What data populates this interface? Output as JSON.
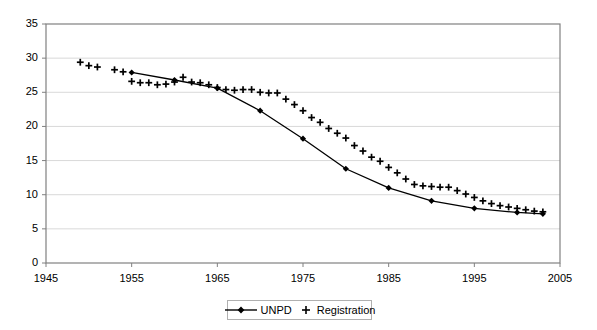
{
  "chart_data": {
    "type": "line",
    "title": "",
    "xlabel": "",
    "ylabel": "",
    "xlim": [
      1945,
      2005
    ],
    "ylim": [
      0,
      35
    ],
    "xticks": [
      1945,
      1955,
      1965,
      1975,
      1985,
      1995,
      2005
    ],
    "yticks": [
      0,
      5,
      10,
      15,
      20,
      25,
      30,
      35
    ],
    "grid": "horizontal",
    "legend_position": "bottom-center",
    "series": [
      {
        "name": "UNPD",
        "marker": "diamond",
        "line": "solid",
        "color": "#000000",
        "x": [
          1955,
          1960,
          1965,
          1970,
          1975,
          1980,
          1985,
          1990,
          1995,
          2000,
          2003
        ],
        "values": [
          27.9,
          26.8,
          25.6,
          22.3,
          18.2,
          13.8,
          11.0,
          9.1,
          8.0,
          7.4,
          7.2
        ]
      },
      {
        "name": "Registration",
        "marker": "plus",
        "line": "none",
        "color": "#000000",
        "x": [
          1949,
          1950,
          1951,
          1953,
          1954,
          1955,
          1956,
          1957,
          1958,
          1959,
          1960,
          1961,
          1962,
          1963,
          1964,
          1965,
          1966,
          1967,
          1968,
          1969,
          1970,
          1971,
          1972,
          1973,
          1974,
          1975,
          1976,
          1977,
          1978,
          1979,
          1980,
          1981,
          1982,
          1983,
          1984,
          1985,
          1986,
          1987,
          1988,
          1989,
          1990,
          1991,
          1992,
          1993,
          1994,
          1995,
          1996,
          1997,
          1998,
          1999,
          2000,
          2001,
          2002,
          2003
        ],
        "values": [
          29.4,
          28.9,
          28.7,
          28.3,
          28.0,
          26.6,
          26.4,
          26.4,
          26.1,
          26.2,
          26.5,
          27.2,
          26.5,
          26.4,
          26.1,
          25.7,
          25.4,
          25.3,
          25.4,
          25.4,
          25.0,
          24.9,
          24.9,
          24.0,
          23.2,
          22.3,
          21.3,
          20.6,
          19.7,
          19.0,
          18.3,
          17.2,
          16.4,
          15.5,
          14.9,
          14.0,
          13.2,
          12.3,
          11.5,
          11.3,
          11.2,
          11.1,
          11.1,
          10.6,
          10.1,
          9.6,
          9.1,
          8.7,
          8.4,
          8.2,
          8.0,
          7.8,
          7.6,
          7.5
        ]
      }
    ]
  },
  "legend": {
    "items": [
      {
        "label": "UNPD",
        "marker": "line-diamond"
      },
      {
        "label": "Registration",
        "marker": "plus"
      }
    ]
  },
  "colors": {
    "axis": "#808080",
    "grid": "#d9d9d9",
    "data": "#000000",
    "background": "#ffffff"
  }
}
